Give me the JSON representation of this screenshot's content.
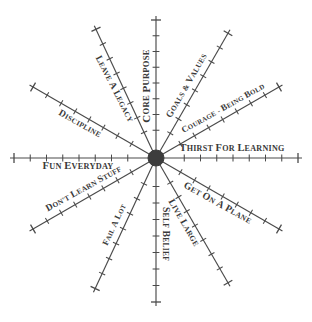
{
  "diagram": {
    "type": "radial-spoke-diagram",
    "background_color": "#ffffff",
    "line_color": "#4a4a4a",
    "hub_color": "#3d3d3d",
    "label_color": "#3a3a3a"
  },
  "chart_data": {
    "type": "scatter",
    "title": "",
    "subtitle": "",
    "xlabel": "",
    "ylabel": "",
    "grid": false,
    "legend": "none",
    "center": {
      "x": 156,
      "y": 158
    },
    "hub_radius": 8,
    "axis_count": 12,
    "angle_step_degrees": 30,
    "tick_count_per_axis": 8,
    "categories": [
      "CORE PURPOSE",
      "GOALS & VALUES",
      "COURAGE - BEING BOLD",
      "THIRST FOR LEARNING",
      "GET ON A PLANE",
      "LIVE LARGE",
      "SELF BELIEF",
      "FAIL A LOT",
      "DON'T LEARN STUFF",
      "FUN EVERYDAY",
      "DISCIPLINE",
      "LEAVE A LEGACY"
    ],
    "axes": [
      {
        "label": "CORE PURPOSE",
        "angle_deg": 270,
        "length": 142,
        "label_rotation": -90,
        "label_offset": 72,
        "label_size": 9.5
      },
      {
        "label": "GOALS & VALUES",
        "angle_deg": 300,
        "length": 148,
        "label_rotation": -60,
        "label_offset": 78,
        "label_size": 8.2
      },
      {
        "label": "COURAGE - BEING BOLD",
        "angle_deg": 330,
        "length": 146,
        "label_rotation": -29,
        "label_offset": 83,
        "label_size": 7.6
      },
      {
        "label": "THIRST FOR LEARNING",
        "angle_deg": 0,
        "length": 146,
        "label_rotation": 0,
        "label_offset": 76,
        "label_size": 9.0
      },
      {
        "label": "GET ON A PLANE",
        "angle_deg": 30,
        "length": 146,
        "label_rotation": 29,
        "label_offset": 76,
        "label_size": 8.6
      },
      {
        "label": "LIVE LARGE",
        "angle_deg": 60,
        "length": 148,
        "label_rotation": 60,
        "label_offset": 70,
        "label_size": 8.4
      },
      {
        "label": "SELF BELIEF",
        "angle_deg": 90,
        "length": 148,
        "label_rotation": 90,
        "label_offset": 76,
        "label_size": 8.4
      },
      {
        "label": "FAIL A LOT",
        "angle_deg": 115,
        "length": 148,
        "label_rotation": -65,
        "label_offset": 78,
        "label_size": 7.4
      },
      {
        "label": "DON'T LEARN STUFF",
        "angle_deg": 150,
        "length": 146,
        "label_rotation": -29,
        "label_offset": 78,
        "label_size": 8.2
      },
      {
        "label": "FUN EVERYDAY",
        "angle_deg": 180,
        "length": 146,
        "label_rotation": 0,
        "label_offset": 78,
        "label_size": 9.2
      },
      {
        "label": "DISCIPLINE",
        "angle_deg": 210,
        "length": 146,
        "label_rotation": 29,
        "label_offset": 83,
        "label_size": 8.2
      },
      {
        "label": "LEAVE A LEGACY",
        "angle_deg": 245,
        "length": 146,
        "label_rotation": 63,
        "label_offset": 80,
        "label_size": 8.2
      }
    ]
  }
}
